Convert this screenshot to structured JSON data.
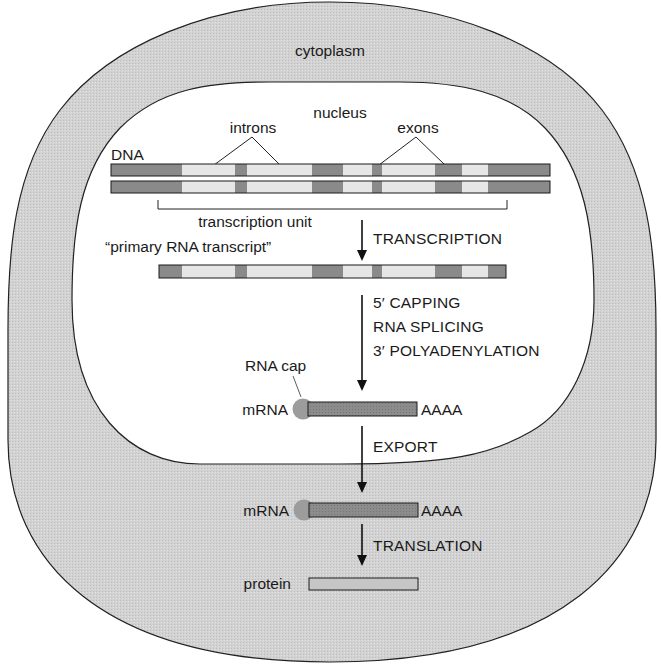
{
  "compartments": {
    "outer": {
      "label": "cytoplasm",
      "fill": "#d4d4d4",
      "stroke": "#222222"
    },
    "inner": {
      "label": "nucleus",
      "fill": "#ffffff",
      "stroke": "#222222"
    }
  },
  "dna": {
    "label": "DNA",
    "intron_label": "introns",
    "exon_label": "exons",
    "transcription_unit_label": "transcription unit",
    "segments": [
      {
        "type": "flank",
        "x0": 111,
        "x1": 182
      },
      {
        "type": "exon",
        "x0": 182,
        "x1": 235
      },
      {
        "type": "intron",
        "x0": 235,
        "x1": 247
      },
      {
        "type": "exon",
        "x0": 247,
        "x1": 312
      },
      {
        "type": "intron",
        "x0": 312,
        "x1": 343
      },
      {
        "type": "exon",
        "x0": 343,
        "x1": 372
      },
      {
        "type": "intron",
        "x0": 372,
        "x1": 382
      },
      {
        "type": "exon",
        "x0": 382,
        "x1": 435
      },
      {
        "type": "intron",
        "x0": 435,
        "x1": 462
      },
      {
        "type": "exon",
        "x0": 462,
        "x1": 488
      },
      {
        "type": "flank",
        "x0": 488,
        "x1": 550
      }
    ]
  },
  "primary_transcript": {
    "label": "“primary RNA transcript”",
    "segments": [
      {
        "type": "intron",
        "x0": 159,
        "x1": 182
      },
      {
        "type": "exon",
        "x0": 182,
        "x1": 235
      },
      {
        "type": "intron",
        "x0": 235,
        "x1": 247
      },
      {
        "type": "exon",
        "x0": 247,
        "x1": 312
      },
      {
        "type": "intron",
        "x0": 312,
        "x1": 343
      },
      {
        "type": "exon",
        "x0": 343,
        "x1": 372
      },
      {
        "type": "intron",
        "x0": 372,
        "x1": 382
      },
      {
        "type": "exon",
        "x0": 382,
        "x1": 435
      },
      {
        "type": "intron",
        "x0": 435,
        "x1": 462
      },
      {
        "type": "exon",
        "x0": 462,
        "x1": 488
      },
      {
        "type": "intron",
        "x0": 488,
        "x1": 506
      }
    ]
  },
  "steps": {
    "transcription": "TRANSCRIPTION",
    "processing": [
      "5′ CAPPING",
      "RNA SPLICING",
      "3′ POLYADENYLATION"
    ],
    "export": "EXPORT",
    "translation": "TRANSLATION"
  },
  "mature_mrna": {
    "nuclear_label": "mRNA",
    "cytoplasmic_label": "mRNA",
    "cap_label": "RNA cap",
    "polya_tail": "AAAA"
  },
  "product": {
    "label": "protein"
  },
  "colors": {
    "dark_segment": "#8a8a8a",
    "light_segment": "#e6e6e6",
    "mrna_bar": "#8f8f8f",
    "protein_bar": "#c4c4c4",
    "cap": "#9a9a9a",
    "line": "#1a1a1a"
  }
}
